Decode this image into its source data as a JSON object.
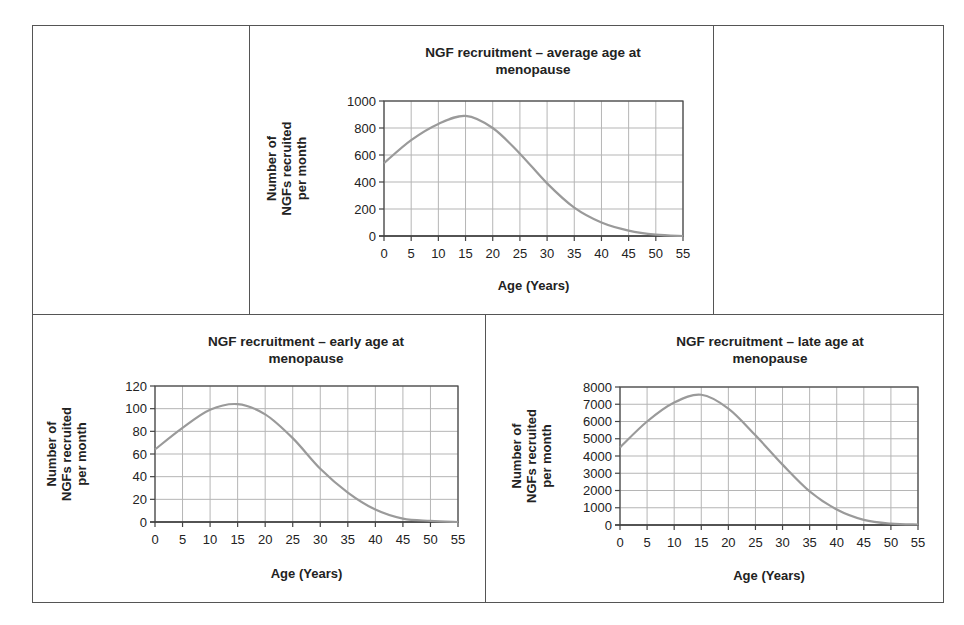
{
  "chart_data": [
    {
      "id": "average",
      "type": "line",
      "title": "NGF recruitment – average age at menopause",
      "title_lines": [
        "NGF recruitment – average age at",
        "menopause"
      ],
      "xlabel": "Age (Years)",
      "ylabel_lines": [
        "Number of",
        "NGFs recruited",
        "per month"
      ],
      "x": [
        0,
        5,
        10,
        15,
        20,
        25,
        30,
        35,
        40,
        45,
        50,
        55
      ],
      "values": [
        540,
        710,
        830,
        890,
        800,
        610,
        390,
        210,
        100,
        40,
        10,
        0
      ],
      "xlim": [
        0,
        55
      ],
      "ylim": [
        0,
        1000
      ],
      "xticks": [
        0,
        5,
        10,
        15,
        20,
        25,
        30,
        35,
        40,
        45,
        50,
        55
      ],
      "yticks": [
        0,
        200,
        400,
        600,
        800,
        1000
      ],
      "grid": true,
      "legend": null
    },
    {
      "id": "early",
      "type": "line",
      "title": "NGF recruitment – early age at menopause",
      "title_lines": [
        "NGF recruitment – early age at",
        "menopause"
      ],
      "xlabel": "Age (Years)",
      "ylabel_lines": [
        "Number of",
        "NGFs recruited",
        "per month"
      ],
      "x": [
        0,
        5,
        10,
        15,
        20,
        25,
        30,
        35,
        40,
        45,
        50,
        55
      ],
      "values": [
        64,
        83,
        99,
        104,
        95,
        74,
        47,
        26,
        11,
        3,
        1,
        0
      ],
      "xlim": [
        0,
        55
      ],
      "ylim": [
        0,
        120
      ],
      "xticks": [
        0,
        5,
        10,
        15,
        20,
        25,
        30,
        35,
        40,
        45,
        50,
        55
      ],
      "yticks": [
        0,
        20,
        40,
        60,
        80,
        100,
        120
      ],
      "grid": true,
      "legend": null
    },
    {
      "id": "late",
      "type": "line",
      "title": "NGF recruitment – late age at menopause",
      "title_lines": [
        "NGF recruitment – late age at",
        "menopause"
      ],
      "xlabel": "Age (Years)",
      "ylabel_lines": [
        "Number of",
        "NGFs recruited",
        "per month"
      ],
      "x": [
        0,
        5,
        10,
        15,
        20,
        25,
        30,
        35,
        40,
        45,
        50,
        55
      ],
      "values": [
        4500,
        6000,
        7100,
        7550,
        6750,
        5200,
        3500,
        1950,
        900,
        300,
        80,
        30
      ],
      "xlim": [
        0,
        55
      ],
      "ylim": [
        0,
        8000
      ],
      "xticks": [
        0,
        5,
        10,
        15,
        20,
        25,
        30,
        35,
        40,
        45,
        50,
        55
      ],
      "yticks": [
        0,
        1000,
        2000,
        3000,
        4000,
        5000,
        6000,
        7000,
        8000
      ],
      "grid": true,
      "legend": null
    }
  ],
  "style": {
    "line_color": "#9a9a9a",
    "grid_color": "#b5b5b5",
    "axis_color": "#444444",
    "frame_color": "#555555"
  }
}
